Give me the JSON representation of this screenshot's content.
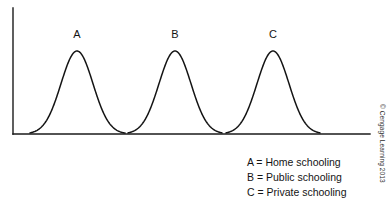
{
  "figure": {
    "background_color": "#ffffff",
    "axis_color": "#1a1a1a",
    "curve_color": "#141414"
  },
  "curve_labels": [
    {
      "text": "A"
    },
    {
      "text": "B"
    },
    {
      "text": "C"
    }
  ],
  "legend": {
    "rows": [
      {
        "text": "A = Home schooling"
      },
      {
        "text": "B = Public schooling"
      },
      {
        "text": "C = Private schooling"
      }
    ]
  },
  "credit": {
    "text": "© Cengage Learning 2013"
  },
  "chart_data": {
    "type": "line",
    "title": "",
    "xlabel": "",
    "ylabel": "",
    "grid": false,
    "legend_position": "bottom-right",
    "axes": {
      "y_axis_x_px": 13,
      "y_axis_top_px": 8,
      "x_axis_y_px": 134,
      "x_axis_right_px": 370,
      "ticks": [],
      "tick_labels": []
    },
    "series": [
      {
        "name": "A",
        "label": "A = Home schooling",
        "peak_label": "A",
        "mean_px": 77,
        "peak_y_px": 51,
        "peak_height_px": 83,
        "baseline_start_px": 30,
        "baseline_end_px": 125,
        "std_dev_px": 16,
        "relative_peak_height": 1.0,
        "relative_spread": 1.0
      },
      {
        "name": "B",
        "label": "B = Public schooling",
        "peak_label": "B",
        "mean_px": 175,
        "peak_y_px": 51,
        "peak_height_px": 83,
        "baseline_start_px": 128,
        "baseline_end_px": 222,
        "std_dev_px": 16,
        "relative_peak_height": 1.0,
        "relative_spread": 1.0
      },
      {
        "name": "C",
        "label": "C = Private schooling",
        "peak_label": "C",
        "mean_px": 273,
        "peak_y_px": 51,
        "peak_height_px": 83,
        "baseline_start_px": 226,
        "baseline_end_px": 320,
        "std_dev_px": 16,
        "relative_peak_height": 1.0,
        "relative_spread": 1.0
      }
    ]
  }
}
